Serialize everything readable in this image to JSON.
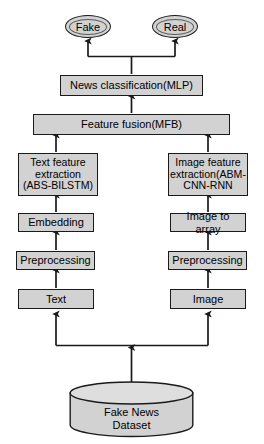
{
  "diagram": {
    "type": "flowchart",
    "colors": {
      "node_fill": "#d2d2d2",
      "node_stroke": "#1a1a1a",
      "arrow": "#1a1a1a",
      "background": "#ffffff",
      "text": "#000000"
    },
    "outputs": [
      {
        "id": "fake",
        "label": "Fake",
        "shape": "ellipse"
      },
      {
        "id": "real",
        "label": "Real",
        "shape": "ellipse"
      }
    ],
    "nodes": {
      "news_classification": {
        "label": "News classification(MLP)",
        "shape": "rectangle"
      },
      "feature_fusion": {
        "label": "Feature fusion(MFB)",
        "shape": "rectangle"
      },
      "text_feature_extraction": {
        "label": "Text feature\nextraction\n(ABS-BILSTM)",
        "shape": "rectangle"
      },
      "image_feature_extraction": {
        "label": "Image feature\nextraction(ABM-\nCNN-RNN",
        "shape": "rectangle"
      },
      "embedding": {
        "label": "Embedding",
        "shape": "rectangle"
      },
      "image_to_array": {
        "label": "Image to array",
        "shape": "rectangle"
      },
      "preprocessing_text": {
        "label": "Preprocessing",
        "shape": "rectangle"
      },
      "preprocessing_image": {
        "label": "Preprocessing",
        "shape": "rectangle"
      },
      "text": {
        "label": "Text",
        "shape": "rectangle"
      },
      "image": {
        "label": "Image",
        "shape": "rectangle"
      },
      "dataset": {
        "label": "Fake News\nDataset",
        "shape": "cylinder"
      }
    },
    "edges": [
      {
        "from": "dataset",
        "to": "text",
        "style": "arrow"
      },
      {
        "from": "dataset",
        "to": "image",
        "style": "arrow"
      },
      {
        "from": "text",
        "to": "preprocessing_text",
        "style": "arrow"
      },
      {
        "from": "image",
        "to": "preprocessing_image",
        "style": "arrow"
      },
      {
        "from": "preprocessing_text",
        "to": "embedding",
        "style": "arrow"
      },
      {
        "from": "preprocessing_image",
        "to": "image_to_array",
        "style": "arrow"
      },
      {
        "from": "embedding",
        "to": "text_feature_extraction",
        "style": "arrow"
      },
      {
        "from": "image_to_array",
        "to": "image_feature_extraction",
        "style": "arrow"
      },
      {
        "from": "text_feature_extraction",
        "to": "feature_fusion",
        "style": "arrow"
      },
      {
        "from": "image_feature_extraction",
        "to": "feature_fusion",
        "style": "arrow"
      },
      {
        "from": "feature_fusion",
        "to": "news_classification",
        "style": "arrow"
      },
      {
        "from": "news_classification",
        "to": "fake",
        "style": "arrow"
      },
      {
        "from": "news_classification",
        "to": "real",
        "style": "arrow"
      }
    ]
  }
}
